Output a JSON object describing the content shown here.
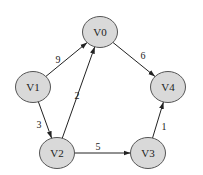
{
  "graph": {
    "type": "directed-weighted",
    "node_fill": "#d9d9d9",
    "node_stroke": "#555555",
    "edge_color": "#222222",
    "nodes": [
      {
        "id": "V0",
        "label": "V0",
        "cx": 100,
        "cy": 32
      },
      {
        "id": "V1",
        "label": "V1",
        "cx": 33,
        "cy": 87
      },
      {
        "id": "V2",
        "label": "V2",
        "cx": 57,
        "cy": 153
      },
      {
        "id": "V3",
        "label": "V3",
        "cx": 148,
        "cy": 153
      },
      {
        "id": "V4",
        "label": "V4",
        "cx": 168,
        "cy": 87
      }
    ],
    "edges": [
      {
        "from": "V1",
        "to": "V0",
        "weight": "9",
        "label_x": 58,
        "label_y": 59
      },
      {
        "from": "V0",
        "to": "V4",
        "weight": "6",
        "label_x": 143,
        "label_y": 55
      },
      {
        "from": "V1",
        "to": "V2",
        "weight": "3",
        "label_x": 39,
        "label_y": 124
      },
      {
        "from": "V2",
        "to": "V0",
        "weight": "2",
        "label_x": 77,
        "label_y": 95
      },
      {
        "from": "V2",
        "to": "V3",
        "weight": "5",
        "label_x": 98,
        "label_y": 146
      },
      {
        "from": "V3",
        "to": "V4",
        "weight": "1",
        "label_x": 164,
        "label_y": 126
      }
    ]
  }
}
